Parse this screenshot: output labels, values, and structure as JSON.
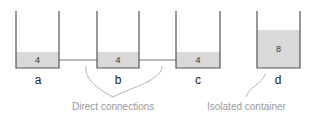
{
  "diagram": {
    "containers": [
      {
        "id": "a",
        "label": "a",
        "value": "4",
        "left": 16,
        "right": 59,
        "top": 11,
        "bottom": 68,
        "water_top": 52
      },
      {
        "id": "b",
        "label": "b",
        "value": "4",
        "left": 97,
        "right": 139,
        "top": 11,
        "bottom": 68,
        "water_top": 52
      },
      {
        "id": "c",
        "label": "c",
        "value": "4",
        "left": 176,
        "right": 220,
        "top": 11,
        "bottom": 68,
        "water_top": 52
      },
      {
        "id": "d",
        "label": "d",
        "value": "8",
        "left": 257,
        "right": 300,
        "top": 11,
        "bottom": 68,
        "water_top": 30
      }
    ],
    "connections": [
      {
        "from": "a",
        "to": "b",
        "y": 60
      },
      {
        "from": "b",
        "to": "c",
        "y": 60
      }
    ],
    "annotations": {
      "direct": "Direct connections",
      "isolated": "Isolated container"
    },
    "colors": {
      "wall": "#555555",
      "water": "#d9d9d9",
      "pipe": "#777777",
      "annotation": "#9a9a9a"
    }
  }
}
